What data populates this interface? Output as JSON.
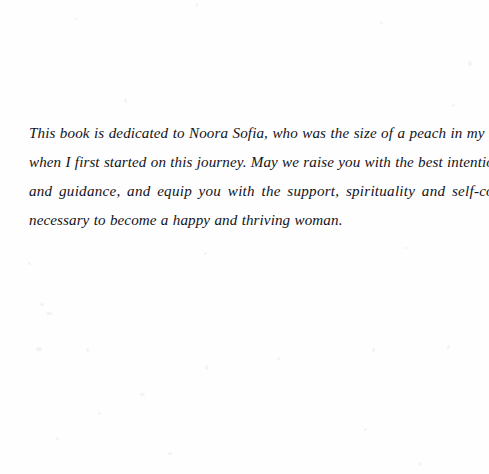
{
  "document": {
    "type": "book-dedication-page",
    "background_color": "#fefefe",
    "text_color": "#13131a",
    "dedication": {
      "full_text": "This book is dedicated to Noora Sofia, who was the size of a peach in my tummy when I first started on this journey. May we raise you with the best intentions, love and guidance, and equip you with the support, spirituality and self-confidence necessary to become a happy and thriving woman.",
      "lines": [
        "This book is dedicated to Noora Sofia, who was the size of a peach in my tummy",
        "when I first started on this journey. May we raise you with the best intentions, love",
        "and guidance, and equip you with the support, spirituality and self-confidence",
        "necessary to become a happy and thriving woman."
      ]
    }
  }
}
